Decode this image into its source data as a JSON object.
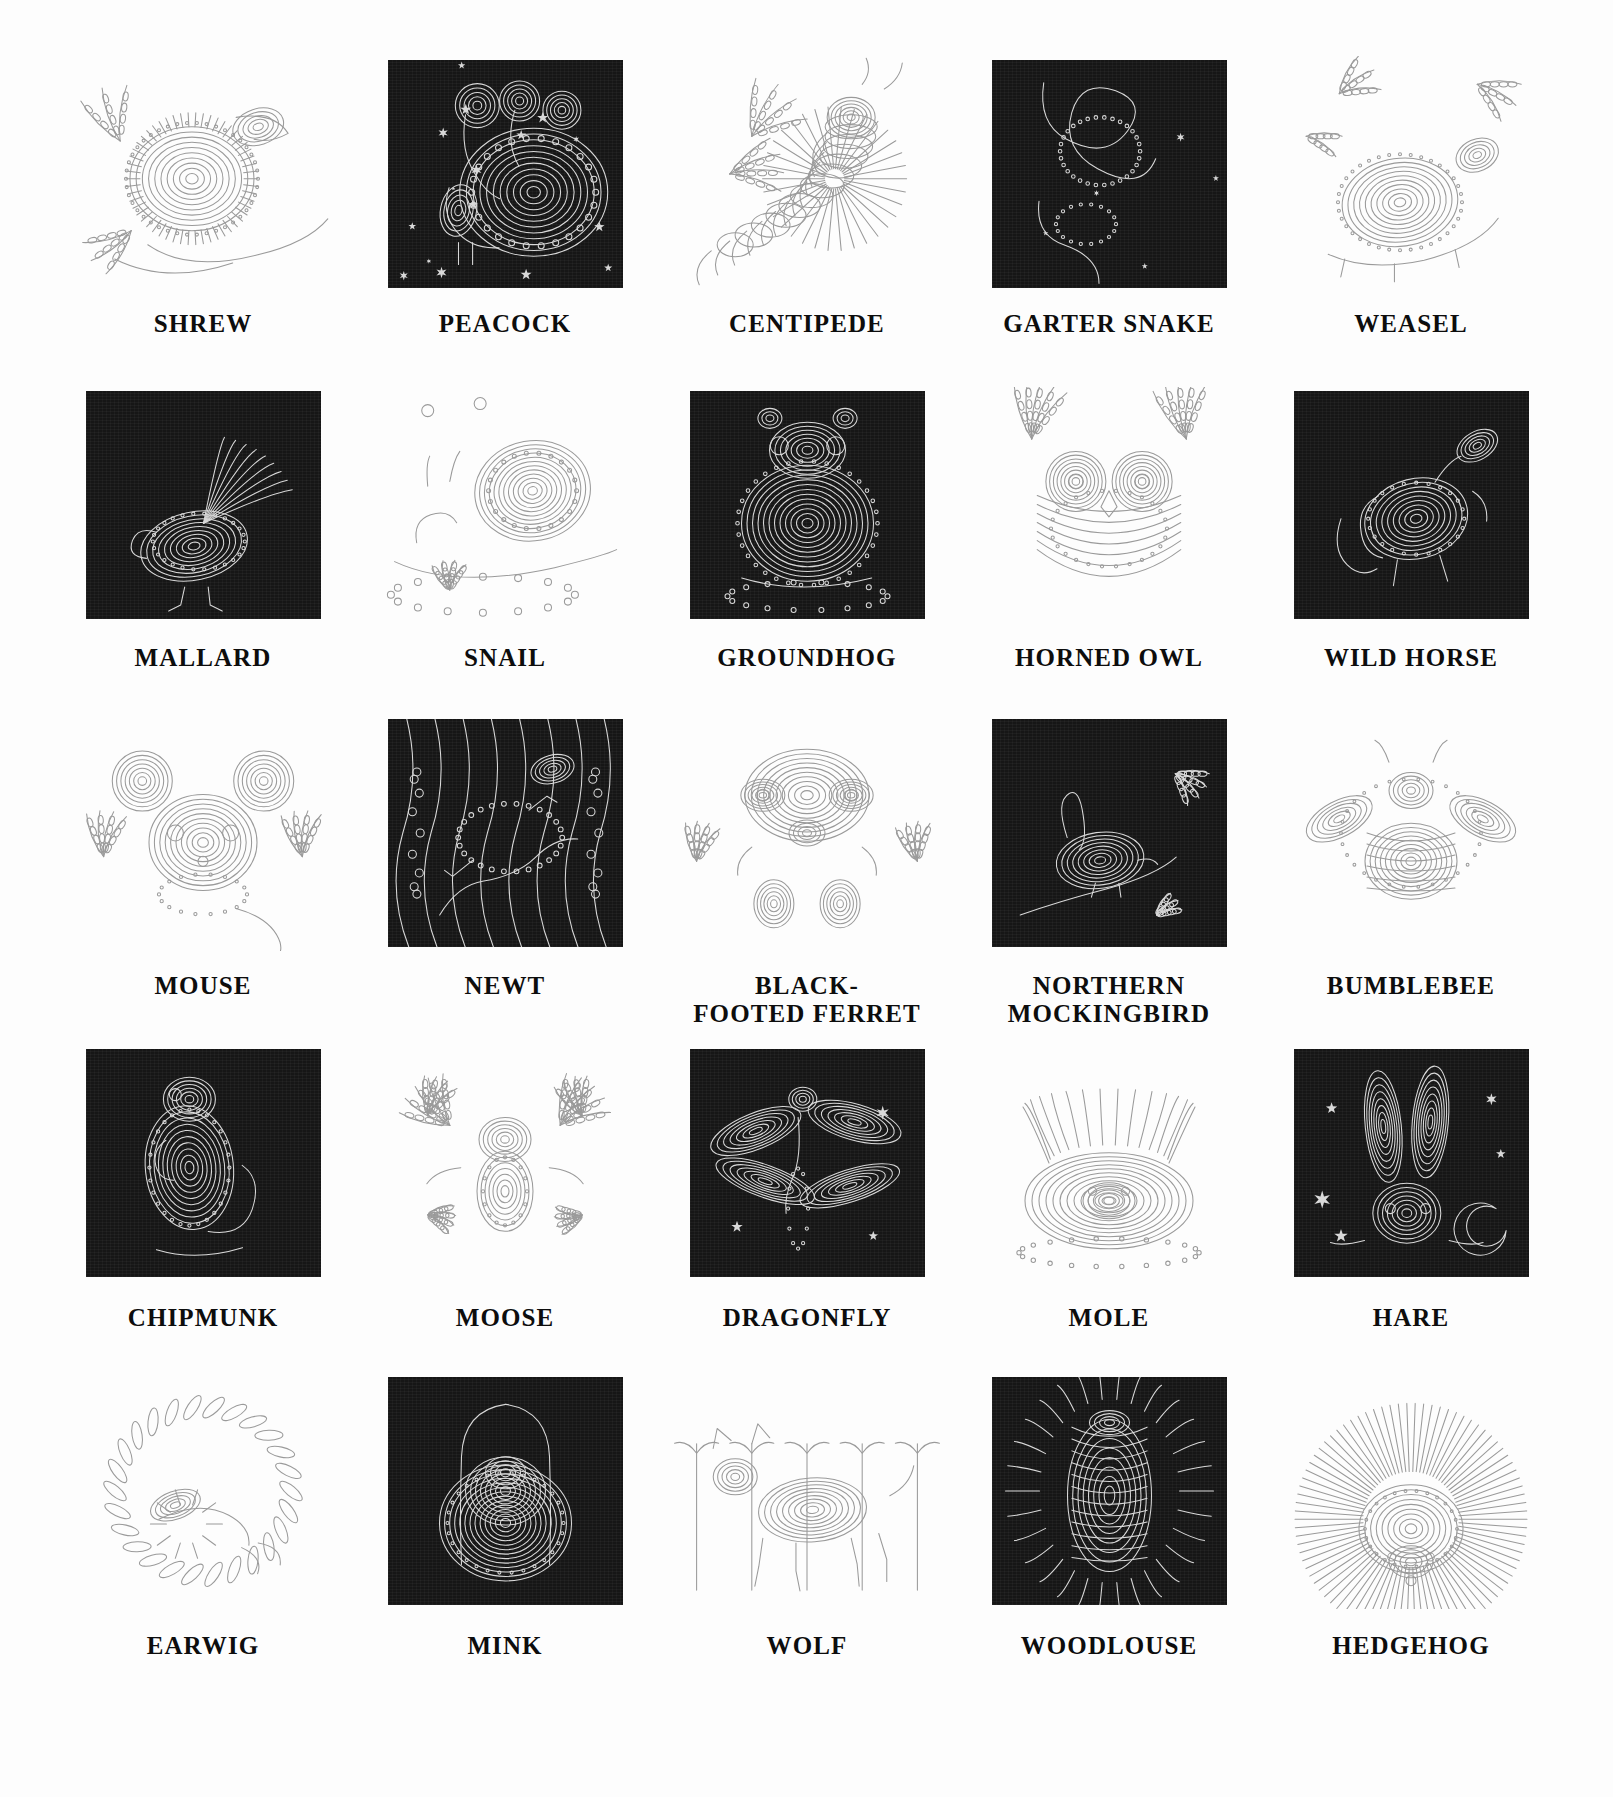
{
  "page": {
    "ghost_text": "",
    "background_color": "#ffffff",
    "plate_dark_color": "#161616",
    "caption_color": "#0d0d0d",
    "columns": 5,
    "rows": 5
  },
  "plates": [
    {
      "label": "SHREW",
      "style": "light",
      "art": "shrew"
    },
    {
      "label": "PEACOCK",
      "style": "dark",
      "art": "peacock"
    },
    {
      "label": "CENTIPEDE",
      "style": "light",
      "art": "centipede"
    },
    {
      "label": "GARTER SNAKE",
      "style": "dark",
      "art": "garter-snake"
    },
    {
      "label": "WEASEL",
      "style": "light",
      "art": "weasel"
    },
    {
      "label": "MALLARD",
      "style": "dark",
      "art": "mallard"
    },
    {
      "label": "SNAIL",
      "style": "light",
      "art": "snail"
    },
    {
      "label": "GROUNDHOG",
      "style": "dark",
      "art": "groundhog"
    },
    {
      "label": "HORNED OWL",
      "style": "light",
      "art": "horned-owl"
    },
    {
      "label": "WILD HORSE",
      "style": "dark",
      "art": "wild-horse"
    },
    {
      "label": "MOUSE",
      "style": "light",
      "art": "mouse"
    },
    {
      "label": "NEWT",
      "style": "dark",
      "art": "newt"
    },
    {
      "label": "BLACK-\nFOOTED FERRET",
      "style": "light",
      "art": "black-footed-ferret"
    },
    {
      "label": "NORTHERN\nMOCKINGBIRD",
      "style": "dark",
      "art": "northern-mockingbird"
    },
    {
      "label": "BUMBLEBEE",
      "style": "light",
      "art": "bumblebee"
    },
    {
      "label": "CHIPMUNK",
      "style": "dark",
      "art": "chipmunk"
    },
    {
      "label": "MOOSE",
      "style": "light",
      "art": "moose"
    },
    {
      "label": "DRAGONFLY",
      "style": "dark",
      "art": "dragonfly"
    },
    {
      "label": "MOLE",
      "style": "light",
      "art": "mole"
    },
    {
      "label": "HARE",
      "style": "dark",
      "art": "hare"
    },
    {
      "label": "EARWIG",
      "style": "light",
      "art": "earwig"
    },
    {
      "label": "MINK",
      "style": "dark",
      "art": "mink"
    },
    {
      "label": "WOLF",
      "style": "light",
      "art": "wolf"
    },
    {
      "label": "WOODLOUSE",
      "style": "dark",
      "art": "woodlouse"
    },
    {
      "label": "HEDGEHOG",
      "style": "light",
      "art": "hedgehog"
    }
  ]
}
